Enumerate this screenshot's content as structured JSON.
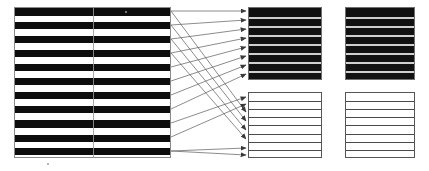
{
  "figure": {
    "background_color": "#ffffff",
    "width": 429,
    "height": 171
  },
  "source_block": {
    "name": "source-stripe-block",
    "x": 14,
    "y": 7,
    "width": 157,
    "height": 151,
    "border_color": "#8a8a8a",
    "dark_color": "#0d0d0d",
    "light_color": "#ffffff",
    "divider_x": 78,
    "stripe_count": 22,
    "dark_stripe_count": 11,
    "stripes": [
      {
        "type": "dark",
        "top": 0,
        "height": 8
      },
      {
        "type": "light",
        "top": 8,
        "height": 6
      },
      {
        "type": "dark",
        "top": 14,
        "height": 7
      },
      {
        "type": "light",
        "top": 21,
        "height": 7
      },
      {
        "type": "dark",
        "top": 28,
        "height": 7
      },
      {
        "type": "light",
        "top": 35,
        "height": 7
      },
      {
        "type": "dark",
        "top": 42,
        "height": 7
      },
      {
        "type": "light",
        "top": 49,
        "height": 7
      },
      {
        "type": "dark",
        "top": 56,
        "height": 7
      },
      {
        "type": "light",
        "top": 63,
        "height": 7
      },
      {
        "type": "dark",
        "top": 70,
        "height": 7
      },
      {
        "type": "light",
        "top": 77,
        "height": 7
      },
      {
        "type": "dark",
        "top": 84,
        "height": 7
      },
      {
        "type": "light",
        "top": 91,
        "height": 7
      },
      {
        "type": "dark",
        "top": 98,
        "height": 7
      },
      {
        "type": "light",
        "top": 105,
        "height": 7
      },
      {
        "type": "dark",
        "top": 112,
        "height": 8
      },
      {
        "type": "light",
        "top": 120,
        "height": 7
      },
      {
        "type": "dark",
        "top": 127,
        "height": 7
      },
      {
        "type": "light",
        "top": 134,
        "height": 6
      },
      {
        "type": "dark",
        "top": 140,
        "height": 7
      },
      {
        "type": "light",
        "top": 147,
        "height": 4
      }
    ]
  },
  "target_panels": [
    {
      "name": "target-panel-top-left",
      "style": "dark",
      "x": 248,
      "y": 7,
      "width": 74,
      "height": 73,
      "fill_color": "#111111",
      "rule_color": "#cfcfcf",
      "border_color": "#6f6f6f",
      "band_count": 8,
      "rule_offsets": [
        9,
        18,
        27,
        36,
        45,
        54,
        63
      ]
    },
    {
      "name": "target-panel-top-right",
      "style": "dark",
      "x": 345,
      "y": 7,
      "width": 70,
      "height": 73,
      "fill_color": "#111111",
      "rule_color": "#cfcfcf",
      "border_color": "#6f6f6f",
      "band_count": 8,
      "rule_offsets": [
        9,
        18,
        27,
        36,
        45,
        54,
        63
      ]
    },
    {
      "name": "target-panel-bottom-left",
      "style": "light",
      "x": 248,
      "y": 92,
      "width": 74,
      "height": 66,
      "fill_color": "#ffffff",
      "rule_color": "#4a4a4a",
      "border_color": "#555555",
      "band_count": 8,
      "rule_offsets": [
        8,
        16,
        24,
        32,
        41,
        49,
        57
      ]
    },
    {
      "name": "target-panel-bottom-right",
      "style": "light",
      "x": 345,
      "y": 92,
      "width": 70,
      "height": 66,
      "fill_color": "#ffffff",
      "rule_color": "#4a4a4a",
      "border_color": "#555555",
      "band_count": 8,
      "rule_offsets": [
        8,
        16,
        24,
        32,
        41,
        49,
        57
      ]
    }
  ],
  "connectors": {
    "name": "mapping-arrows",
    "stroke_color": "#5a5a5a",
    "stroke_width": 0.7,
    "arrow_direction": "left-to-right",
    "count": 16,
    "lines": [
      {
        "x1": 171,
        "y1": 11,
        "x2": 246,
        "y2": 11
      },
      {
        "x1": 171,
        "y1": 11,
        "x2": 246,
        "y2": 112
      },
      {
        "x1": 171,
        "y1": 25,
        "x2": 246,
        "y2": 20
      },
      {
        "x1": 171,
        "y1": 25,
        "x2": 246,
        "y2": 121
      },
      {
        "x1": 171,
        "y1": 39,
        "x2": 246,
        "y2": 29
      },
      {
        "x1": 171,
        "y1": 39,
        "x2": 246,
        "y2": 130
      },
      {
        "x1": 171,
        "y1": 53,
        "x2": 246,
        "y2": 38
      },
      {
        "x1": 171,
        "y1": 53,
        "x2": 246,
        "y2": 139
      },
      {
        "x1": 171,
        "y1": 67,
        "x2": 246,
        "y2": 47
      },
      {
        "x1": 171,
        "y1": 81,
        "x2": 246,
        "y2": 56
      },
      {
        "x1": 171,
        "y1": 95,
        "x2": 246,
        "y2": 65
      },
      {
        "x1": 171,
        "y1": 109,
        "x2": 246,
        "y2": 74
      },
      {
        "x1": 171,
        "y1": 123,
        "x2": 246,
        "y2": 97
      },
      {
        "x1": 171,
        "y1": 137,
        "x2": 246,
        "y2": 104
      },
      {
        "x1": 171,
        "y1": 151,
        "x2": 246,
        "y2": 148
      },
      {
        "x1": 171,
        "y1": 151,
        "x2": 246,
        "y2": 155
      }
    ]
  },
  "specks": [
    {
      "name": "speck-top",
      "x": 125,
      "y": 11,
      "size": 2
    },
    {
      "name": "speck-bottom",
      "x": 47,
      "y": 163,
      "size": 2
    }
  ]
}
